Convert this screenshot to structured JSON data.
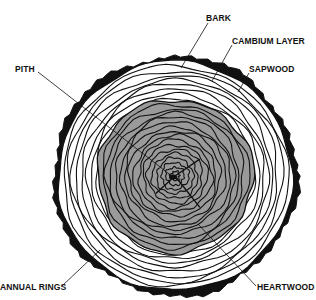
{
  "diagram": {
    "center": {
      "x": 175,
      "y": 176
    },
    "outer_radius": 120,
    "heartwood_radius": 78,
    "ring_count_sapwood": 8,
    "ring_count_heartwood": 16,
    "colors": {
      "ink": "#111111",
      "heartwood_fill": "#9a9a9a",
      "sapwood_fill": "#ffffff",
      "background": "#ffffff"
    },
    "labels": [
      {
        "id": "bark",
        "text": "BARK",
        "x": 206,
        "y": 13,
        "line": [
          208,
          23,
          181,
          68
        ]
      },
      {
        "id": "cambium",
        "text": "CAMBIUM LAYER",
        "x": 232,
        "y": 36,
        "line": [
          232,
          45,
          212,
          81
        ]
      },
      {
        "id": "sapwood",
        "text": "SAPWOOD",
        "x": 249,
        "y": 64,
        "line": [
          249,
          73,
          238,
          92
        ]
      },
      {
        "id": "pith",
        "text": "PITH",
        "x": 15,
        "y": 64,
        "line": [
          38,
          72,
          173,
          177
        ]
      },
      {
        "id": "annual-rings",
        "text": "ANNUAL RINGS",
        "x": 0,
        "y": 282,
        "line": [
          62,
          286,
          100,
          250
        ]
      },
      {
        "id": "heartwood",
        "text": "HEARTWOOD",
        "x": 257,
        "y": 282,
        "line": [
          256,
          286,
          198,
          224
        ]
      }
    ]
  }
}
